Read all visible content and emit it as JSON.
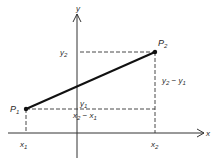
{
  "diagram": {
    "axes": {
      "x_label": "x",
      "y_label": "y"
    },
    "points": [
      {
        "name": "P",
        "sub": "1"
      },
      {
        "name": "P",
        "sub": "2"
      }
    ],
    "tick_labels": {
      "x1": {
        "base": "x",
        "sub": "1"
      },
      "x2": {
        "base": "x",
        "sub": "2"
      },
      "y1": {
        "base": "y",
        "sub": "1"
      },
      "y2": {
        "base": "y",
        "sub": "2"
      }
    },
    "differences": {
      "dx": {
        "a": "x",
        "a_sub": "2",
        "op": " − ",
        "b": "x",
        "b_sub": "1"
      },
      "dy": {
        "a": "y",
        "a_sub": "2",
        "op": " − ",
        "b": "y",
        "b_sub": "1"
      }
    },
    "colors": {
      "line": "#1a1a1a",
      "text": "#2a2a2a",
      "background": "#ffffff"
    }
  }
}
